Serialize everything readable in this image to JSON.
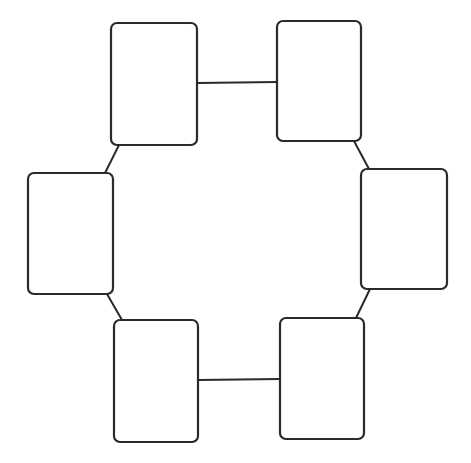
{
  "diagram": {
    "type": "ring-of-boxes",
    "stroke_color": "#2a2a2a",
    "background": "#ffffff",
    "corner_radius": 6,
    "nodes": [
      {
        "id": "top-left",
        "x": 111,
        "y": 23,
        "w": 86,
        "h": 122,
        "label": ""
      },
      {
        "id": "top-right",
        "x": 277,
        "y": 21,
        "w": 84,
        "h": 120,
        "label": ""
      },
      {
        "id": "middle-right",
        "x": 361,
        "y": 169,
        "w": 86,
        "h": 120,
        "label": ""
      },
      {
        "id": "bottom-right",
        "x": 280,
        "y": 318,
        "w": 84,
        "h": 121,
        "label": ""
      },
      {
        "id": "bottom-left",
        "x": 114,
        "y": 320,
        "w": 84,
        "h": 122,
        "label": ""
      },
      {
        "id": "middle-left",
        "x": 28,
        "y": 173,
        "w": 85,
        "h": 121,
        "label": ""
      }
    ],
    "edges": [
      {
        "from": "top-left",
        "to": "top-right",
        "x1": 197,
        "y1": 83,
        "x2": 277,
        "y2": 82
      },
      {
        "from": "top-right",
        "to": "middle-right",
        "x1": 354,
        "y1": 141,
        "x2": 369,
        "y2": 169
      },
      {
        "from": "middle-right",
        "to": "bottom-right",
        "x1": 370,
        "y1": 289,
        "x2": 356,
        "y2": 318
      },
      {
        "from": "bottom-right",
        "to": "bottom-left",
        "x1": 280,
        "y1": 379,
        "x2": 198,
        "y2": 380
      },
      {
        "from": "bottom-left",
        "to": "middle-left",
        "x1": 122,
        "y1": 320,
        "x2": 107,
        "y2": 294
      },
      {
        "from": "middle-left",
        "to": "top-left",
        "x1": 105,
        "y1": 173,
        "x2": 119,
        "y2": 145
      }
    ]
  }
}
